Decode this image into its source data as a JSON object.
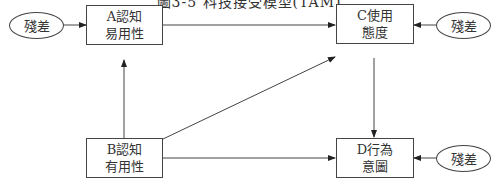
{
  "title": "圖3-5 科技接受模型(TAM)",
  "nodes": {
    "A": {
      "line1": "A認知",
      "line2": "易用性"
    },
    "B": {
      "line1": "B認知",
      "line2": "有用性"
    },
    "C": {
      "line1": "C使用",
      "line2": "態度"
    },
    "D": {
      "line1": "D行為",
      "line2": "意圖"
    }
  },
  "residuals": {
    "a": "殘差",
    "c": "殘差",
    "d": "殘差"
  },
  "edges": [
    {
      "from": "residual-a",
      "to": "A"
    },
    {
      "from": "residual-c",
      "to": "C"
    },
    {
      "from": "residual-d",
      "to": "D"
    },
    {
      "from": "A",
      "to": "C"
    },
    {
      "from": "B",
      "to": "A"
    },
    {
      "from": "B",
      "to": "C"
    },
    {
      "from": "B",
      "to": "D"
    },
    {
      "from": "C",
      "to": "D"
    }
  ]
}
